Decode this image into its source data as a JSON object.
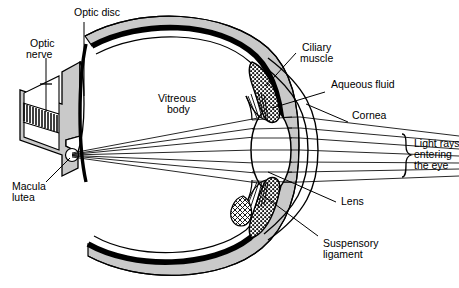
{
  "diagram": {
    "type": "anatomical-diagram",
    "background_color": "#ffffff",
    "ink_color": "#000000",
    "shading_color": "#c9c9c9",
    "labels": {
      "optic_disc": "Optic disc",
      "optic_nerve_line1": "Optic",
      "optic_nerve_line2": "nerve",
      "vitreous_line1": "Vitreous",
      "vitreous_line2": "body",
      "ciliary_line1": "Ciliary",
      "ciliary_line2": "muscle",
      "aqueous_fluid": "Aqueous fluid",
      "cornea": "Cornea",
      "light_rays_line1": "Light rays",
      "light_rays_line2": "entering",
      "light_rays_line3": "the eye",
      "lens": "Lens",
      "suspensory_line1": "Suspensory",
      "suspensory_line2": "ligament",
      "macula_line1": "Macula",
      "macula_line2": "lutea"
    },
    "structures": [
      "sclera",
      "choroid",
      "retina",
      "vitreous-body",
      "lens",
      "cornea",
      "aqueous-humour",
      "ciliary-muscle-upper",
      "ciliary-muscle-lower",
      "suspensory-ligament-upper",
      "suspensory-ligament-lower",
      "optic-nerve",
      "optic-disc",
      "macula-lutea",
      "light-rays"
    ],
    "light_ray_count": 7
  }
}
